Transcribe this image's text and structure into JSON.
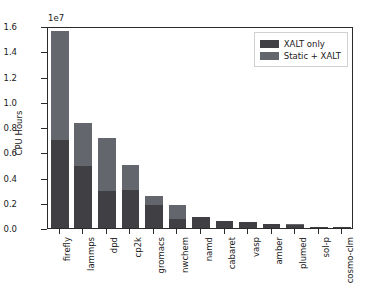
{
  "chart_data": {
    "type": "bar",
    "title": "",
    "xlabel": "",
    "ylabel": "CPU Hours",
    "y_offset_text": "1e7",
    "ylim": [
      0,
      1.6
    ],
    "yticks": [
      "0.0",
      "0.2",
      "0.4",
      "0.6",
      "0.8",
      "1.0",
      "1.2",
      "1.4",
      "1.6"
    ],
    "ytick_values": [
      0.0,
      0.2,
      0.4,
      0.6,
      0.8,
      1.0,
      1.2,
      1.4,
      1.6
    ],
    "grid": false,
    "stacked": true,
    "legend_position": "upper right",
    "categories": [
      "firefly",
      "lammps",
      "dpd",
      "cp2k",
      "gromacs",
      "nwchem",
      "namd",
      "cabaret",
      "vasp",
      "amber",
      "plumed",
      "sol-p",
      "cosmo-clm"
    ],
    "series": [
      {
        "name": "XALT only",
        "color": "#3f3f44",
        "values": [
          0.695,
          0.495,
          0.295,
          0.3,
          0.185,
          0.075,
          0.085,
          0.055,
          0.05,
          0.03,
          0.027,
          0.007,
          0.003
        ]
      },
      {
        "name": "Static + XALT",
        "color": "#63666c",
        "values": [
          0.865,
          0.335,
          0.415,
          0.2,
          0.065,
          0.11,
          0.0,
          0.0,
          0.0,
          0.0,
          0.005,
          0.0,
          0.0
        ]
      }
    ],
    "totals": [
      1.56,
      0.83,
      0.71,
      0.5,
      0.25,
      0.185,
      0.085,
      0.055,
      0.05,
      0.03,
      0.032,
      0.007,
      0.003
    ],
    "units_note": "values are in units of 1e7 CPU Hours"
  },
  "legend": {
    "entries": [
      {
        "label": "XALT only",
        "color": "#3f3f44"
      },
      {
        "label": "Static + XALT",
        "color": "#63666c"
      }
    ]
  }
}
